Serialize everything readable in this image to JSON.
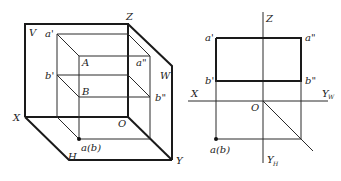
{
  "figure": {
    "left_view": {
      "title": "3D projection system (V, H, W planes)",
      "labels": {
        "Z": "Z",
        "V": "V",
        "W": "W",
        "X": "X",
        "O": "O",
        "H": "H",
        "Y": "Y",
        "a_prime": "a'",
        "b_prime": "b'",
        "A": "A",
        "B": "B",
        "a_dprime": "a\"",
        "b_dprime": "b\"",
        "ab": "a(b)"
      }
    },
    "right_view": {
      "title": "Orthographic three-view projection",
      "labels": {
        "Z": "Z",
        "X": "X",
        "O": "O",
        "Yw": "Y",
        "Yw_sub": "W",
        "Yh": "Y",
        "Yh_sub": "H",
        "a_prime": "a'",
        "a_dprime": "a\"",
        "b_prime": "b'",
        "b_dprime": "b\"",
        "ab": "a(b)"
      }
    }
  }
}
